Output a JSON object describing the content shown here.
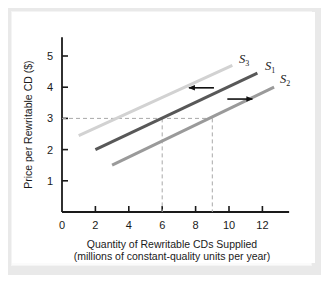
{
  "figure": {
    "background_color": "#ffffff",
    "mat_color": "#e9e9e9"
  },
  "chart_data": {
    "type": "line",
    "title": "",
    "xlabel": "Quantity of Rewritable CDs Supplied",
    "xlabel_line2": "(millions of constant-quality units per year)",
    "ylabel": "Price per Rewritable CD ($)",
    "xlim": [
      0,
      13.6
    ],
    "ylim": [
      0,
      5.6
    ],
    "xticks": [
      0,
      2,
      4,
      6,
      8,
      10,
      12
    ],
    "xtick_labels": [
      "0",
      "2",
      "4",
      "6",
      "8",
      "10",
      "12"
    ],
    "yticks": [
      1,
      2,
      3,
      4,
      5
    ],
    "ytick_labels": [
      "1",
      "2",
      "3",
      "4",
      "5"
    ],
    "grid": false,
    "legend_position": "inline-end-labels",
    "series": [
      {
        "name": "S3",
        "label": "S",
        "subscript": "3",
        "color": "#d2d2d2",
        "linewidth": 3,
        "x": [
          1.0,
          10.2
        ],
        "y": [
          2.45,
          4.7
        ],
        "label_x": 10.6,
        "label_y": 4.78
      },
      {
        "name": "S1",
        "label": "S",
        "subscript": "1",
        "color": "#585858",
        "linewidth": 3,
        "x": [
          2.0,
          11.7
        ],
        "y": [
          2.0,
          4.45
        ],
        "label_x": 12.15,
        "label_y": 4.55
      },
      {
        "name": "S2",
        "label": "S",
        "subscript": "2",
        "color": "#9a9a9a",
        "linewidth": 3,
        "x": [
          3.0,
          12.7
        ],
        "y": [
          1.5,
          4.0
        ],
        "label_x": 13.05,
        "label_y": 4.12
      }
    ],
    "reference_lines": {
      "color": "#a8a8a8",
      "style": "dashed",
      "price": 3,
      "quantities": [
        6,
        9
      ]
    },
    "annotations": [
      {
        "name": "shift-left-arrow",
        "direction": "left",
        "from_x": 9.1,
        "to_x": 7.6,
        "y": 3.98
      },
      {
        "name": "shift-right-arrow",
        "direction": "right",
        "from_x": 9.9,
        "to_x": 11.4,
        "y": 3.62
      }
    ]
  }
}
